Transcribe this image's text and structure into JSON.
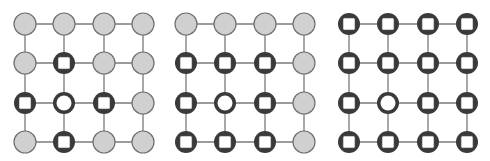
{
  "diagram": {
    "title": "",
    "colors": {
      "edge": "#7a7a7a",
      "idle_fill": "#d0d0d0",
      "idle_stroke": "#707070",
      "active_ring": "#3a3a3a",
      "inner_white": "#ffffff",
      "background": "#ffffff"
    },
    "legend": {
      "idle": "gray filled circle",
      "square": "dark circle with white square",
      "ring": "dark ring with white center"
    },
    "row_y": [
      24,
      63,
      103,
      142
    ],
    "node_radius": 11,
    "grids": [
      {
        "name": "grid-1",
        "col_x": [
          25,
          64,
          104,
          143
        ],
        "nodes": [
          [
            "idle",
            "idle",
            "idle",
            "idle"
          ],
          [
            "idle",
            "square",
            "idle",
            "idle"
          ],
          [
            "square",
            "ring",
            "square",
            "idle"
          ],
          [
            "idle",
            "square",
            "idle",
            "idle"
          ]
        ]
      },
      {
        "name": "grid-2",
        "col_x": [
          186,
          225,
          265,
          304
        ],
        "nodes": [
          [
            "idle",
            "idle",
            "idle",
            "idle"
          ],
          [
            "square",
            "square",
            "square",
            "idle"
          ],
          [
            "square",
            "ring",
            "square",
            "idle"
          ],
          [
            "square",
            "square",
            "square",
            "idle"
          ]
        ]
      },
      {
        "name": "grid-3",
        "col_x": [
          349,
          388,
          428,
          467
        ],
        "nodes": [
          [
            "square",
            "square",
            "square",
            "square"
          ],
          [
            "square",
            "square",
            "square",
            "square"
          ],
          [
            "square",
            "ring",
            "square",
            "square"
          ],
          [
            "square",
            "square",
            "square",
            "square"
          ]
        ]
      }
    ]
  }
}
